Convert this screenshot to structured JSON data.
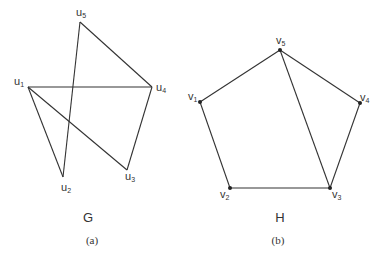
{
  "graphs": [
    {
      "id": "G",
      "title": "G",
      "caption": "(a)",
      "nodes": [
        {
          "id": "u1",
          "base": "u",
          "sub": "1",
          "x": 28,
          "y": 87,
          "lx": -14,
          "ly": -2,
          "dot": false
        },
        {
          "id": "u2",
          "base": "u",
          "sub": "2",
          "x": 63,
          "y": 177,
          "lx": -2,
          "ly": 14,
          "dot": false
        },
        {
          "id": "u3",
          "base": "u",
          "sub": "3",
          "x": 127,
          "y": 170,
          "lx": -2,
          "ly": 10,
          "dot": false
        },
        {
          "id": "u4",
          "base": "u",
          "sub": "4",
          "x": 152,
          "y": 87,
          "lx": 4,
          "ly": 4,
          "dot": false
        },
        {
          "id": "u5",
          "base": "u",
          "sub": "5",
          "x": 80,
          "y": 22,
          "lx": -4,
          "ly": -6,
          "dot": false
        }
      ],
      "edges": [
        [
          "u5",
          "u4"
        ],
        [
          "u5",
          "u2"
        ],
        [
          "u1",
          "u4"
        ],
        [
          "u1",
          "u2"
        ],
        [
          "u1",
          "u3"
        ],
        [
          "u4",
          "u3"
        ]
      ],
      "title_pos": {
        "x": 88,
        "y": 222
      },
      "caption_pos": {
        "x": 92,
        "y": 244
      }
    },
    {
      "id": "H",
      "title": "H",
      "caption": "(b)",
      "nodes": [
        {
          "id": "v1",
          "base": "v",
          "sub": "1",
          "x": 200,
          "y": 102,
          "lx": -12,
          "ly": -2,
          "dot": true
        },
        {
          "id": "v2",
          "base": "v",
          "sub": "2",
          "x": 230,
          "y": 188,
          "lx": -10,
          "ly": 10,
          "dot": true
        },
        {
          "id": "v3",
          "base": "v",
          "sub": "3",
          "x": 330,
          "y": 188,
          "lx": 2,
          "ly": 10,
          "dot": true
        },
        {
          "id": "v4",
          "base": "v",
          "sub": "4",
          "x": 360,
          "y": 103,
          "lx": 0,
          "ly": -2,
          "dot": true
        },
        {
          "id": "v5",
          "base": "v",
          "sub": "5",
          "x": 280,
          "y": 50,
          "lx": -4,
          "ly": -6,
          "dot": true
        }
      ],
      "edges": [
        [
          "v5",
          "v1"
        ],
        [
          "v5",
          "v4"
        ],
        [
          "v5",
          "v3"
        ],
        [
          "v1",
          "v2"
        ],
        [
          "v2",
          "v3"
        ],
        [
          "v3",
          "v4"
        ]
      ],
      "title_pos": {
        "x": 280,
        "y": 222
      },
      "caption_pos": {
        "x": 278,
        "y": 244
      }
    }
  ],
  "colors": {
    "edge": "#333333",
    "text": "#333333",
    "node": "#222222"
  }
}
